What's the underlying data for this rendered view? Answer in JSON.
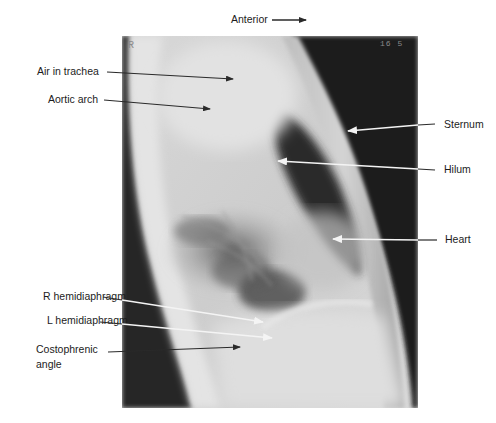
{
  "figure": {
    "title_direction_label": "Anterior",
    "image_markers": {
      "side_marker": "R",
      "corner_text": "16 5"
    },
    "colors": {
      "background": "#ffffff",
      "label_text": "#1c1c1c",
      "arrow_dark": "#2a2a2a",
      "arrow_light": "#f2f2f2",
      "xray_dark": "#1b1b1b",
      "xray_body": "#cfcfcf",
      "xray_bright": "#e6e6e6"
    }
  },
  "labels_left": [
    {
      "id": "air-in-trachea",
      "text": "Air in trachea",
      "arrow_color": "dark"
    },
    {
      "id": "aortic-arch",
      "text": "Aortic arch",
      "arrow_color": "dark"
    },
    {
      "id": "r-hemidiaphragm",
      "text": "R hemidiaphragm",
      "arrow_color": "light"
    },
    {
      "id": "l-hemidiaphragm",
      "text": "L hemidiaphragm",
      "arrow_color": "light"
    },
    {
      "id": "costophrenic-angle",
      "text_line1": "Costophrenic",
      "text_line2": "angle",
      "arrow_color": "dark"
    }
  ],
  "labels_right": [
    {
      "id": "sternum",
      "text": "Sternum",
      "arrow_color": "light"
    },
    {
      "id": "hilum",
      "text": "Hilum",
      "arrow_color": "light"
    },
    {
      "id": "heart",
      "text": "Heart",
      "arrow_color": "light"
    }
  ]
}
